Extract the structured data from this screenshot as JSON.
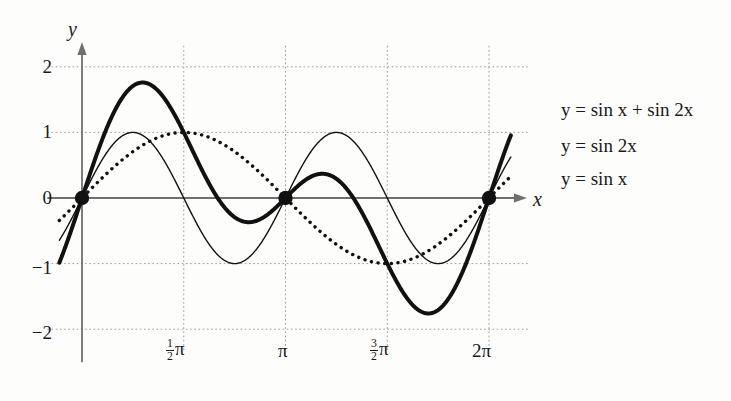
{
  "figure": {
    "background_color": "#fdfdfc",
    "ink_color": "#1a1a1a",
    "grid_color": "#9a9a9a",
    "axis_color": "#6f6f6f"
  },
  "axes": {
    "x_axis_label": "x",
    "y_axis_label": "y",
    "x_ticks": [
      {
        "value": 1.5707963,
        "label_num": "1",
        "label_den": "2",
        "label_sym": "π",
        "kind": "fraction"
      },
      {
        "value": 3.1415927,
        "label_num": "",
        "label_den": "",
        "label_sym": "π",
        "kind": "plain"
      },
      {
        "value": 4.712389,
        "label_num": "3",
        "label_den": "2",
        "label_sym": "π",
        "kind": "fraction"
      },
      {
        "value": 6.2831853,
        "label_num": "",
        "label_den": "",
        "label_sym": "2π",
        "kind": "plain"
      }
    ],
    "y_ticks": [
      {
        "value": 2,
        "label": "2"
      },
      {
        "value": 1,
        "label": "1"
      },
      {
        "value": 0,
        "label": "0"
      },
      {
        "value": -1,
        "label": "−1"
      },
      {
        "value": -2,
        "label": "−2"
      }
    ]
  },
  "legend": {
    "position": "right",
    "entries": [
      {
        "label": "y = sin x + sin 2x",
        "style": "thick-solid"
      },
      {
        "label": "y = sin 2x",
        "style": "thin-solid"
      },
      {
        "label": "y = sin x",
        "style": "dotted"
      }
    ]
  },
  "markers": {
    "description": "filled circles at common zeros",
    "points": [
      {
        "x": 0,
        "y": 0
      },
      {
        "x": 3.1415927,
        "y": 0
      },
      {
        "x": 6.2831853,
        "y": 0
      }
    ]
  },
  "chart_data": {
    "type": "line",
    "title": "",
    "subtitle": "",
    "xlabel": "x",
    "ylabel": "y",
    "xlim": [
      -0.35,
      6.62
    ],
    "ylim": [
      -2.35,
      2.35
    ],
    "grid": true,
    "legend_position": "right",
    "x_tick_values": [
      1.5707963,
      3.1415927,
      4.712389,
      6.2831853
    ],
    "x_tick_labels": [
      "1/2 π",
      "π",
      "3/2 π",
      "2π"
    ],
    "y_tick_values": [
      2,
      1,
      0,
      -1,
      -2
    ],
    "y_tick_labels": [
      "2",
      "1",
      "0",
      "−1",
      "−2"
    ],
    "series": [
      {
        "name": "y = sin x + sin 2x",
        "formula": "sin(x) + sin(2x)",
        "style": "thick-solid",
        "linewidth": 4,
        "color": "#111111",
        "key_points": [
          {
            "x": 0,
            "y": 0,
            "note": "zero"
          },
          {
            "x": 0.9359,
            "y": 1.7602,
            "note": "global maximum"
          },
          {
            "x": 2.0944,
            "y": 0,
            "note": "zero"
          },
          {
            "x": 3.1416,
            "y": 0,
            "note": "zero"
          },
          {
            "x": 3.8073,
            "y": 0.369,
            "note": "local maximum"
          },
          {
            "x": 4.1888,
            "y": 0,
            "note": "zero"
          },
          {
            "x": 5.3473,
            "y": -1.7602,
            "note": "global minimum"
          },
          {
            "x": 6.2832,
            "y": 0,
            "note": "zero"
          }
        ]
      },
      {
        "name": "y = sin 2x",
        "formula": "sin(2x)",
        "style": "thin-solid",
        "linewidth": 1.4,
        "color": "#111111",
        "key_points": [
          {
            "x": 0,
            "y": 0,
            "note": "zero"
          },
          {
            "x": 0.7854,
            "y": 1,
            "note": "maximum"
          },
          {
            "x": 1.5708,
            "y": 0,
            "note": "zero"
          },
          {
            "x": 2.3562,
            "y": -1,
            "note": "minimum"
          },
          {
            "x": 3.1416,
            "y": 0,
            "note": "zero"
          },
          {
            "x": 3.927,
            "y": 1,
            "note": "maximum"
          },
          {
            "x": 4.7124,
            "y": 0,
            "note": "zero"
          },
          {
            "x": 5.4978,
            "y": -1,
            "note": "minimum"
          },
          {
            "x": 6.2832,
            "y": 0,
            "note": "zero"
          }
        ]
      },
      {
        "name": "y = sin x",
        "formula": "sin(x)",
        "style": "dotted",
        "linewidth": 3.2,
        "color": "#111111",
        "key_points": [
          {
            "x": 0,
            "y": 0,
            "note": "zero"
          },
          {
            "x": 1.5708,
            "y": 1,
            "note": "maximum"
          },
          {
            "x": 3.1416,
            "y": 0,
            "note": "zero"
          },
          {
            "x": 4.7124,
            "y": -1,
            "note": "minimum"
          },
          {
            "x": 6.2832,
            "y": 0,
            "note": "zero"
          }
        ]
      }
    ]
  }
}
